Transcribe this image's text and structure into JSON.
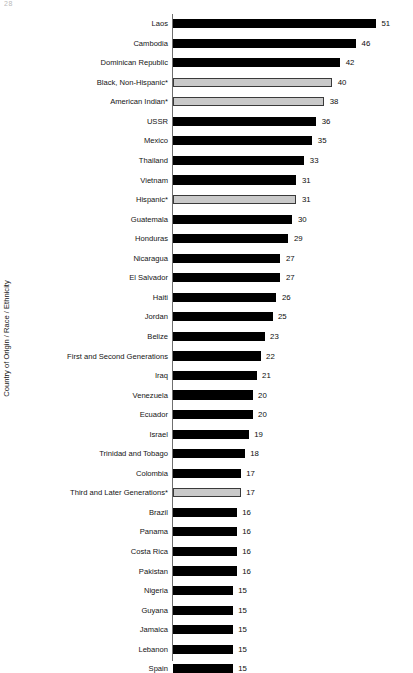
{
  "page": {
    "artifact_text": "28"
  },
  "chart_data": {
    "type": "bar",
    "orientation": "horizontal",
    "title": "",
    "subtitle": "",
    "xlabel": "",
    "ylabel": "Country of Origin / Race / Ethnicity",
    "grid": false,
    "legend": "none",
    "xlim": [
      0,
      51
    ],
    "value_label_suffix": "",
    "series_colors": {
      "country_bar": "#000000",
      "group_bar_fill": "#c9c9c9",
      "group_bar_border": "#3a3a3a",
      "axis_line": "#6f6f6f",
      "text": "#000000",
      "background": "#ffffff"
    },
    "categories": [
      "Laos",
      "Cambodia",
      "Dominican Republic",
      "Black, Non-Hispanic*",
      "American Indian*",
      "USSR",
      "Mexico",
      "Thailand",
      "Vietnam",
      "Hispanic*",
      "Guatemala",
      "Honduras",
      "Nicaragua",
      "El Salvador",
      "Haiti",
      "Jordan",
      "Belize",
      "First and Second Generations",
      "Iraq",
      "Venezuela",
      "Ecuador",
      "Israel",
      "Trinidad and Tobago",
      "Colombia",
      "Third and Later Generations*",
      "Brazil",
      "Panama",
      "Costa Rica",
      "Pakistan",
      "Nigeria",
      "Guyana",
      "Jamaica",
      "Lebanon",
      "Spain"
    ],
    "values": [
      51,
      46,
      42,
      40,
      38,
      36,
      35,
      33,
      31,
      31,
      30,
      29,
      27,
      27,
      26,
      25,
      23,
      22,
      21,
      20,
      20,
      19,
      18,
      17,
      17,
      16,
      16,
      16,
      16,
      15,
      15,
      15,
      15,
      15
    ],
    "bar_styles": [
      "dark",
      "dark",
      "dark",
      "light",
      "light",
      "dark",
      "dark",
      "dark",
      "dark",
      "light",
      "dark",
      "dark",
      "dark",
      "dark",
      "dark",
      "dark",
      "dark",
      "dark",
      "dark",
      "dark",
      "dark",
      "dark",
      "dark",
      "dark",
      "light",
      "dark",
      "dark",
      "dark",
      "dark",
      "dark",
      "dark",
      "dark",
      "dark",
      "dark"
    ]
  }
}
